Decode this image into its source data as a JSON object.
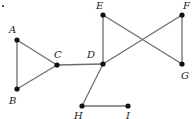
{
  "diagram": {
    "type": "graph",
    "nodes": [
      {
        "id": "A",
        "label": "A",
        "x": 17,
        "y": 40,
        "lx": 9,
        "ly": 33
      },
      {
        "id": "B",
        "label": "B",
        "x": 17,
        "y": 89,
        "lx": 9,
        "ly": 104
      },
      {
        "id": "C",
        "label": "C",
        "x": 57,
        "y": 65,
        "lx": 54,
        "ly": 58
      },
      {
        "id": "D",
        "label": "D",
        "x": 103,
        "y": 64,
        "lx": 87,
        "ly": 58
      },
      {
        "id": "E",
        "label": "E",
        "x": 103,
        "y": 15,
        "lx": 96,
        "ly": 9
      },
      {
        "id": "F",
        "label": "F",
        "x": 182,
        "y": 15,
        "lx": 183,
        "ly": 9
      },
      {
        "id": "G",
        "label": "G",
        "x": 182,
        "y": 64,
        "lx": 181,
        "ly": 79
      },
      {
        "id": "H",
        "label": "H",
        "x": 82,
        "y": 106,
        "lx": 74,
        "ly": 119
      },
      {
        "id": "I",
        "label": "I",
        "x": 128,
        "y": 106,
        "lx": 126,
        "ly": 119
      }
    ],
    "edges": [
      [
        "A",
        "B"
      ],
      [
        "A",
        "C"
      ],
      [
        "B",
        "C"
      ],
      [
        "C",
        "D"
      ],
      [
        "D",
        "E"
      ],
      [
        "E",
        "G"
      ],
      [
        "D",
        "F"
      ],
      [
        "F",
        "G"
      ],
      [
        "D",
        "H"
      ],
      [
        "H",
        "I"
      ]
    ],
    "stray_mark": {
      "x": 2,
      "y": 5
    }
  }
}
